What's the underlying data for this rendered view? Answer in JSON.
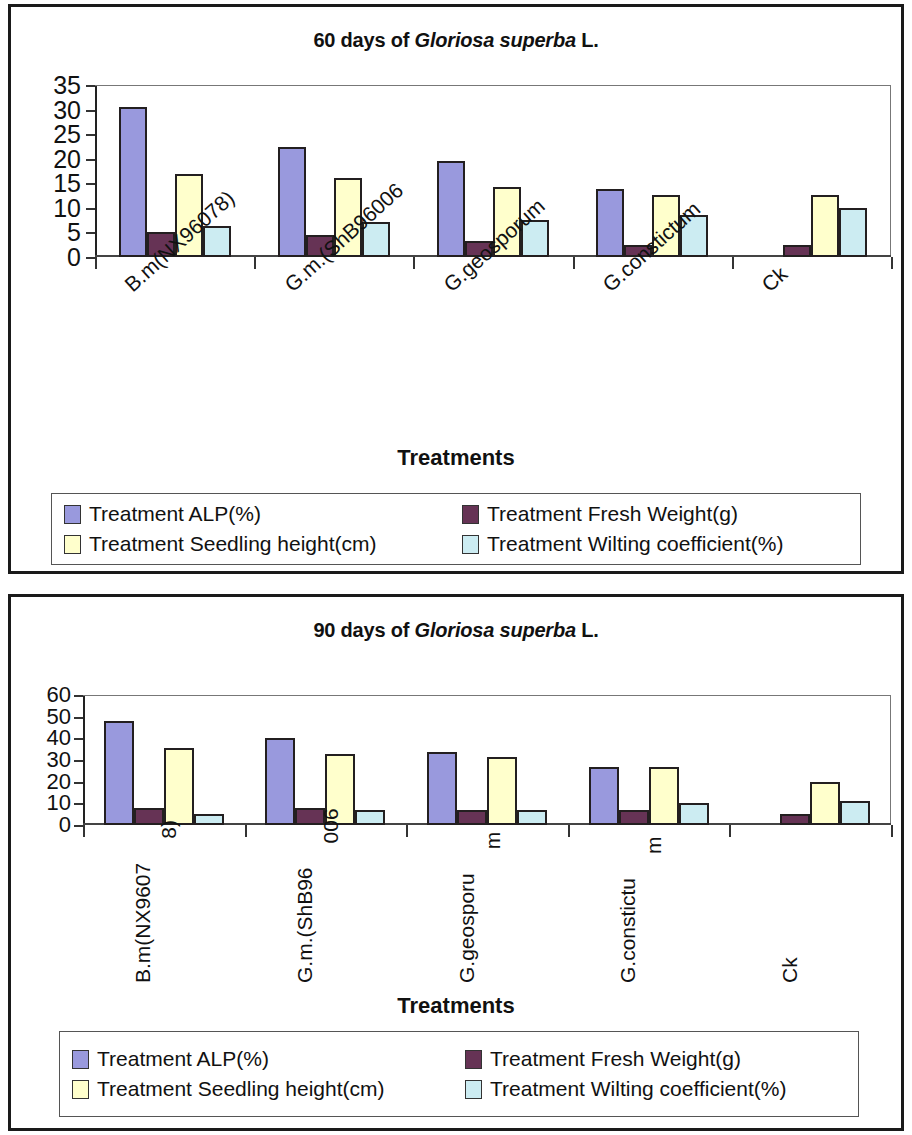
{
  "charts": [
    {
      "id": "chart-60-days",
      "title_prefix": "60 days of ",
      "title_italic": "Gloriosa superba",
      "title_suffix": " L.",
      "title_full": "60 days of Gloriosa superba L.",
      "xlabel": "Treatments",
      "legend": [
        {
          "label": "Treatment  ALP(%)",
          "color": "#9999dd"
        },
        {
          "label": "Treatment  Fresh Weight(g)",
          "color": "#663355"
        },
        {
          "label": "Treatment  Seedling height(cm)",
          "color": "#ffffcc"
        },
        {
          "label": "Treatment  Wilting coefficient(%)",
          "color": "#ccecf2"
        }
      ],
      "chart_data": {
        "type": "bar",
        "title": "60 days of Gloriosa superba L.",
        "xlabel": "Treatments",
        "ylabel": "",
        "ylim": [
          0,
          35
        ],
        "yticks": [
          0,
          5,
          10,
          15,
          20,
          25,
          30,
          35
        ],
        "grid": false,
        "legend_position": "bottom",
        "categories": [
          "B.m(NX96078)",
          "G.m.(ShB96006",
          "G.geosporum",
          "G.constictum",
          "Ck"
        ],
        "series": [
          {
            "name": "Treatment  ALP(%)",
            "color": "#9999dd",
            "values": [
              30.5,
              22.3,
              19.6,
              13.8,
              0
            ]
          },
          {
            "name": "Treatment  Fresh Weight(g)",
            "color": "#663355",
            "values": [
              5.1,
              4.5,
              3.2,
              2.4,
              2.5
            ]
          },
          {
            "name": "Treatment  Seedling height(cm)",
            "color": "#ffffcc",
            "values": [
              16.9,
              16.0,
              14.2,
              12.7,
              12.7
            ]
          },
          {
            "name": "Treatment  Wilting coefficient(%)",
            "color": "#ccecf2",
            "values": [
              6.4,
              7.2,
              7.6,
              8.5,
              10.0
            ]
          }
        ]
      }
    },
    {
      "id": "chart-90-days",
      "title_prefix": "90 days of ",
      "title_italic": "Gloriosa superba",
      "title_suffix": " L.",
      "title_full": "90 days of Gloriosa superba L.",
      "xlabel": "Treatments",
      "legend": [
        {
          "label": "Treatment  ALP(%)",
          "color": "#9999dd"
        },
        {
          "label": "Treatment  Fresh Weight(g)",
          "color": "#663355"
        },
        {
          "label": "Treatment  Seedling height(cm)",
          "color": "#ffffcc"
        },
        {
          "label": "Treatment  Wilting coefficient(%)",
          "color": "#ccecf2"
        }
      ],
      "chart_data": {
        "type": "bar",
        "title": "90 days of Gloriosa superba L.",
        "xlabel": "Treatments",
        "ylabel": "",
        "ylim": [
          0,
          60
        ],
        "yticks": [
          0,
          10,
          20,
          30,
          40,
          50,
          60
        ],
        "grid": false,
        "legend_position": "bottom",
        "categories": [
          "B.m(NX9607 8)",
          "G.m.(ShB96 006",
          "G.geosporu m",
          "G.constictu m",
          "Ck"
        ],
        "categories_wrapped": [
          [
            "B.m(NX9607",
            "8)"
          ],
          [
            "G.m.(ShB96",
            "006"
          ],
          [
            "G.geosporu",
            "m"
          ],
          [
            "G.constictu",
            "m"
          ],
          [
            "Ck",
            ""
          ]
        ],
        "series": [
          {
            "name": "Treatment  ALP(%)",
            "color": "#9999dd",
            "values": [
              48,
              40,
              33.5,
              27,
              0
            ]
          },
          {
            "name": "Treatment  Fresh Weight(g)",
            "color": "#663355",
            "values": [
              8,
              8,
              7,
              7,
              5
            ]
          },
          {
            "name": "Treatment  Seedling height(cm)",
            "color": "#ffffcc",
            "values": [
              35.5,
              33,
              31.5,
              27,
              20
            ]
          },
          {
            "name": "Treatment  Wilting coefficient(%)",
            "color": "#ccecf2",
            "values": [
              5,
              7,
              7,
              10,
              11
            ]
          }
        ]
      }
    }
  ]
}
